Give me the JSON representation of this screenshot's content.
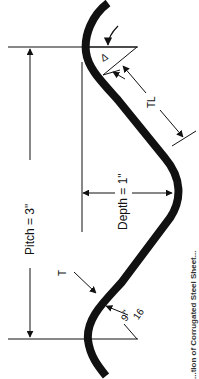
{
  "figure": {
    "type": "corrugated-steel-sheet-profile",
    "colors": {
      "ink": "#111111",
      "background": "#ffffff"
    },
    "labels": {
      "pitch": "Pitch = 3\"",
      "depth": "Depth = 1\"",
      "tangent_length": "TL",
      "tangent_angle": "Δ",
      "thickness": "T",
      "radius_num": "9",
      "radius_den": "16",
      "radius_unit": "\""
    },
    "caption_partial": "...tion of Corrugated Steel Sheet..."
  }
}
